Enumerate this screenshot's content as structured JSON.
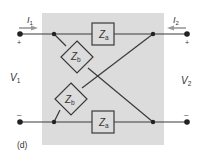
{
  "figure": {
    "label": "(d)",
    "background_box_color": "#dcdcdc",
    "wire_color": "#3a3a3a",
    "arrow_color": "#9a9a9a"
  },
  "ports": {
    "left": {
      "current_label": "I",
      "current_sub": "1",
      "voltage_label": "V",
      "voltage_sub": "1",
      "plus": "+",
      "minus": "–"
    },
    "right": {
      "current_label": "I",
      "current_sub": "2",
      "voltage_label": "V",
      "voltage_sub": "2",
      "plus": "+",
      "minus": "–"
    }
  },
  "components": {
    "za_top": {
      "name": "Z",
      "sub": "a"
    },
    "za_bottom": {
      "name": "Z",
      "sub": "a"
    },
    "zb_upper": {
      "name": "Z",
      "sub": "b"
    },
    "zb_lower": {
      "name": "Z",
      "sub": "b"
    }
  }
}
